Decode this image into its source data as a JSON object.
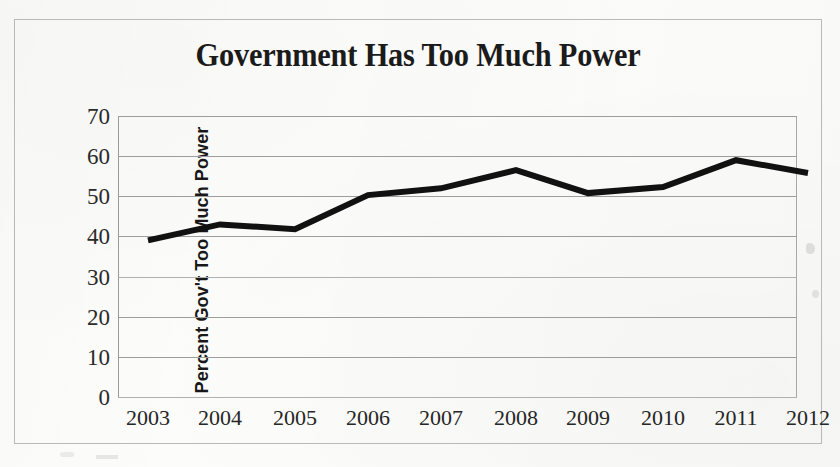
{
  "chart_data": {
    "type": "line",
    "title": "Government Has Too Much Power",
    "xlabel": "",
    "ylabel": "Percent Gov't Too Much Power",
    "categories": [
      "2003",
      "2004",
      "2005",
      "2006",
      "2007",
      "2008",
      "2009",
      "2010",
      "2011",
      "2012"
    ],
    "values": [
      39,
      43,
      41.8,
      50.3,
      52,
      56.5,
      50.8,
      52.3,
      59,
      55.8
    ],
    "series": [
      {
        "name": "Percent Gov't Too Much Power",
        "values": [
          39,
          43,
          41.8,
          50.3,
          52,
          56.5,
          50.8,
          52.3,
          59,
          55.8
        ]
      }
    ],
    "ylim": [
      0,
      70
    ],
    "yticks": [
      "0",
      "10",
      "20",
      "30",
      "40",
      "50",
      "60",
      "70"
    ],
    "ytick_values": [
      0,
      10,
      20,
      30,
      40,
      50,
      60,
      70
    ],
    "grid": true,
    "grid_axis": "y",
    "legend": false,
    "legend_position": "none",
    "line_color": "#111111",
    "grid_color": "#9d9d9d",
    "background_color": "#fcfcfa",
    "text_color": "#1b1b1b"
  },
  "figure": {
    "title": "Government Has Too Much Power",
    "y_axis_title": "Percent Gov't Too Much Power",
    "x_axis_labels": [
      "2003",
      "2004",
      "2005",
      "2006",
      "2007",
      "2008",
      "2009",
      "2010",
      "2011",
      "2012"
    ],
    "y_axis_labels": [
      "70",
      "60",
      "50",
      "40",
      "30",
      "20",
      "10",
      "0"
    ]
  }
}
